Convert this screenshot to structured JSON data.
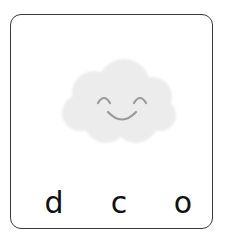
{
  "card": {
    "image": {
      "icon": "smiling-cloud-icon",
      "colors": {
        "cloud_fill": "#ececec",
        "face_stroke": "#9a9a9a"
      }
    },
    "letters": [
      "d",
      "c",
      "o"
    ]
  },
  "colors": {
    "border": "#3a3a3a",
    "text": "#111111",
    "background": "#ffffff"
  }
}
